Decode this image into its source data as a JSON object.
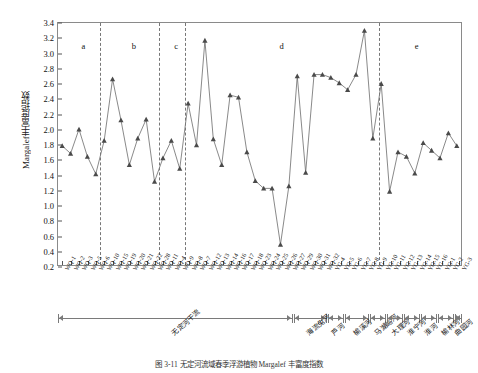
{
  "chart_data": {
    "type": "line",
    "title": "",
    "xlabel": "",
    "ylabel": "Margalef丰富度指数",
    "ylim": [
      0.2,
      3.4
    ],
    "ytick_step": 0.2,
    "yticks": [
      "0.2",
      "0.4",
      "0.6",
      "0.8",
      "1.0",
      "1.2",
      "1.4",
      "1.6",
      "1.8",
      "2.0",
      "2.2",
      "2.4",
      "2.6",
      "2.8",
      "3.0",
      "3.2",
      "3.4"
    ],
    "grid": false,
    "legend": "none",
    "marker": "triangle",
    "line_color": "#6b6b6b",
    "marker_color": "#4a4a4a",
    "categories": [
      "WQ-1",
      "WQ-2",
      "WQ-3",
      "WQ-5",
      "WQ-6",
      "WQ-10",
      "WQ-15",
      "WQ-19",
      "WQ-20",
      "WQ-21",
      "WQ-22",
      "WQ-28",
      "WQ-11",
      "WQ-4",
      "WQ-9",
      "WQ-8",
      "WQ-7",
      "WQ-12",
      "WQ-13",
      "WQ-14",
      "WQ-16",
      "WQ-17",
      "WQ-18",
      "WQ-23",
      "WQ-24",
      "WQ-25",
      "WQ-26",
      "WQ-27",
      "WQ-29",
      "WQ-30",
      "WQ-31",
      "WQ-32",
      "YG-4",
      "YG-5",
      "YG-6",
      "YG-7",
      "YG-8",
      "YG-9",
      "YG-10",
      "YG-11",
      "YG-12",
      "YG-13",
      "YG-14",
      "YG-15",
      "YG-16",
      "YG-1",
      "YG-2",
      "YG-3"
    ],
    "values": [
      1.78,
      1.68,
      2.0,
      1.64,
      1.41,
      1.85,
      2.66,
      2.12,
      1.53,
      1.88,
      2.13,
      1.31,
      1.62,
      1.85,
      1.48,
      2.34,
      1.79,
      3.17,
      1.87,
      1.53,
      2.45,
      2.42,
      1.7,
      1.32,
      1.22,
      1.22,
      0.48,
      1.25,
      2.7,
      1.43,
      2.72,
      2.72,
      2.68,
      2.61,
      2.52,
      2.72,
      3.3,
      1.88,
      2.6,
      1.18,
      1.7,
      1.64,
      1.42,
      1.82,
      1.72,
      1.62,
      1.95,
      1.78
    ],
    "annotations": [
      {
        "label": "a",
        "x_index_center": 2.5
      },
      {
        "label": "b",
        "x_index_center": 8.5
      },
      {
        "label": "c",
        "x_index_center": 13.5
      },
      {
        "label": "d",
        "x_index_center": 26.0
      },
      {
        "label": "e",
        "x_index_center": 42.0
      }
    ],
    "dividers_after_index": [
      4,
      11,
      14,
      37
    ],
    "groups": [
      {
        "label": "无定河干流",
        "start": 0,
        "end": 27
      },
      {
        "label": "海流兔河",
        "start": 28,
        "end": 31
      },
      {
        "label": "芦河",
        "start": 32,
        "end": 33
      },
      {
        "label": "榆溪河",
        "start": 34,
        "end": 36
      },
      {
        "label": "马湖峪河",
        "start": 37,
        "end": 38
      },
      {
        "label": "大理河",
        "start": 39,
        "end": 40
      },
      {
        "label": "淮宁河",
        "start": 41,
        "end": 42
      },
      {
        "label": "淮河",
        "start": 43,
        "end": 44
      },
      {
        "label": "榆林河",
        "start": 45,
        "end": 46
      },
      {
        "label": "曲园河",
        "start": 47,
        "end": 47
      }
    ]
  },
  "caption": {
    "text": "图 3-11  无定河流域春季浮游植物 Margalef 丰富度指数"
  }
}
